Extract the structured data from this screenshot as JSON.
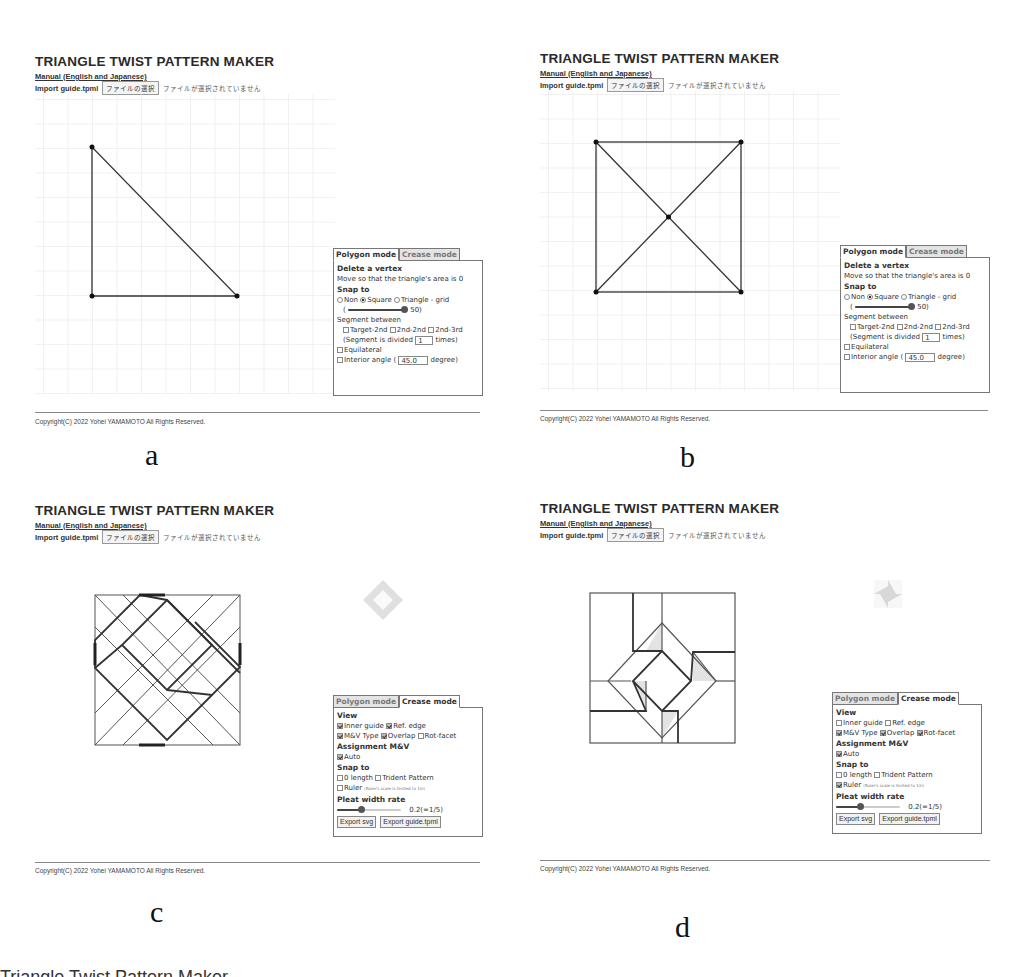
{
  "app": {
    "title": "TRIANGLE TWIST PATTERN MAKER",
    "manual_link": "Manual (English and Japanese)",
    "import_label": "Import guide.tpml",
    "file_button": "ファイルの選択",
    "file_status": "ファイルが選択されていません",
    "copyright": "Copyright(C) 2022 Yohei YAMAMOTO All Rights Reserved."
  },
  "tabs": {
    "polygon": "Polygon mode",
    "crease": "Crease mode"
  },
  "polygon_panel": {
    "delete_title": "Delete a vertex",
    "delete_hint": "Move so that the triangle's area is 0",
    "snap_title": "Snap to",
    "snap_options": [
      "Non",
      "Square",
      "Triangle - grid"
    ],
    "snap_selected": "Square",
    "grid_slider_value": "50)",
    "grid_slider_open": "(",
    "segment_title": "Segment between",
    "segment_options": [
      "Target-2nd",
      "2nd-2nd",
      "2nd-3rd"
    ],
    "divided_prefix": "(Segment is divided",
    "divided_value": "1",
    "divided_suffix": "times)",
    "equilateral": "Equilateral",
    "interior_angle_prefix": "Interior angle (",
    "interior_angle_value": "45.0",
    "interior_angle_suffix": "degree)"
  },
  "crease_panel": {
    "view_title": "View",
    "inner_guide": "Inner guide",
    "ref_edge": "Ref. edge",
    "mv_type": "M&V Type",
    "overlap": "Overlap",
    "rot_facet": "Rot-facet",
    "assign_title": "Assignment M&V",
    "auto": "Auto",
    "snap_title": "Snap to",
    "zero_length": "0 length",
    "trident": "Trident Pattern",
    "ruler": "Ruler",
    "ruler_note": "(Ruler's scale is limited to 1/n)",
    "pleat_title": "Pleat width rate",
    "pleat_value": "0.2(=1/5)",
    "export_svg": "Export svg",
    "export_tpml": "Export guide.tpml"
  },
  "panels": [
    {
      "label": "a",
      "mode": "Polygon mode",
      "shape": "triangle"
    },
    {
      "label": "b",
      "mode": "Polygon mode",
      "shape": "square with diagonals"
    },
    {
      "label": "c",
      "mode": "Crease mode",
      "view": {
        "inner_guide": true,
        "ref_edge": true,
        "mv_type": true,
        "overlap": true,
        "rot_facet": false
      },
      "auto": true,
      "ruler": false
    },
    {
      "label": "d",
      "mode": "Crease mode",
      "view": {
        "inner_guide": false,
        "ref_edge": false,
        "mv_type": true,
        "overlap": true,
        "rot_facet": true
      },
      "auto": true,
      "ruler": true
    }
  ],
  "captions": {
    "a": "a",
    "b": "b",
    "c": "c",
    "d": "d",
    "cutoff": "Triangle Twist Pattern Maker"
  },
  "colors": {
    "line": "#333333",
    "grid": "#e6e6e6",
    "facet_fill": "#e3e3e3"
  }
}
